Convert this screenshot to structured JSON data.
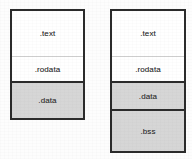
{
  "figure": {
    "background_color": "#fdfdfd",
    "border_color": "#2b2b2b",
    "shaded_color": "#d6d6d6",
    "white_color": "#ffffff",
    "text_color": "#3a3a3a"
  },
  "boxes": [
    {
      "name": "relocatable-object-file",
      "sections": [
        {
          "label": ".text",
          "fill": "white",
          "divider": "none"
        },
        {
          "label": ".rodata",
          "fill": "white",
          "divider": "thin"
        },
        {
          "label": ".data",
          "fill": "gray",
          "divider": "thick"
        }
      ]
    },
    {
      "name": "executable-object-file",
      "sections": [
        {
          "label": ".text",
          "fill": "white",
          "divider": "none"
        },
        {
          "label": ".rodata",
          "fill": "white",
          "divider": "thin"
        },
        {
          "label": ".data",
          "fill": "gray",
          "divider": "thick"
        },
        {
          "label": ".bss",
          "fill": "gray",
          "divider": "thick"
        }
      ]
    }
  ]
}
